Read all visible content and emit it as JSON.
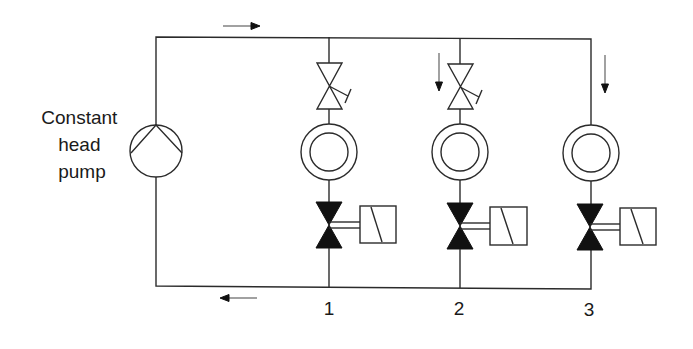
{
  "diagram": {
    "type": "hydronic-circuit",
    "pump": {
      "label_lines": [
        "Constant",
        "head",
        "pump"
      ]
    },
    "flow_arrows": {
      "supply_direction": "right",
      "return_direction": "left",
      "branch_2_direction": "down",
      "branch_3_direction": "down"
    },
    "branches": [
      {
        "id": "1",
        "label": "1",
        "has_balancing_valve": true,
        "has_coil": true,
        "has_control_valve": true
      },
      {
        "id": "2",
        "label": "2",
        "has_balancing_valve": true,
        "has_coil": true,
        "has_control_valve": true
      },
      {
        "id": "3",
        "label": "3",
        "has_balancing_valve": false,
        "has_coil": true,
        "has_control_valve": true
      }
    ],
    "colors": {
      "line": "#2b2b2b",
      "fill": "#111111",
      "background": "#ffffff"
    }
  }
}
